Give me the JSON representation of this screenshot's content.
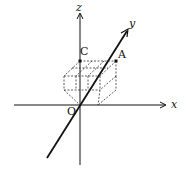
{
  "diagram": {
    "axes": {
      "x_label": "x",
      "y_label": "y",
      "z_label": "z"
    },
    "points": {
      "origin": "O",
      "C": "C",
      "A": "A"
    },
    "colors": {
      "stroke": "#111111",
      "background": "#ffffff"
    }
  }
}
